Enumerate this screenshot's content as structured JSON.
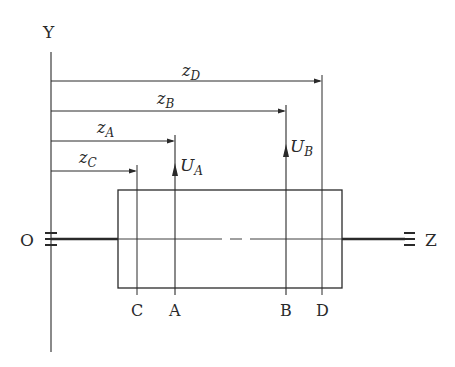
{
  "diagram": {
    "axes": {
      "y_label": "Y",
      "z_label": "Z",
      "origin_label": "O"
    },
    "dimensions": [
      {
        "id": "zD",
        "base": "z",
        "sub": "D"
      },
      {
        "id": "zB",
        "base": "z",
        "sub": "B"
      },
      {
        "id": "zA",
        "base": "z",
        "sub": "A"
      },
      {
        "id": "zC",
        "base": "z",
        "sub": "C"
      }
    ],
    "forces": [
      {
        "id": "UA",
        "base": "U",
        "sub": "A"
      },
      {
        "id": "UB",
        "base": "U",
        "sub": "B"
      }
    ],
    "points": [
      "C",
      "A",
      "B",
      "D"
    ],
    "colors": {
      "ink": "#2a2a2a",
      "background": "#ffffff"
    }
  }
}
